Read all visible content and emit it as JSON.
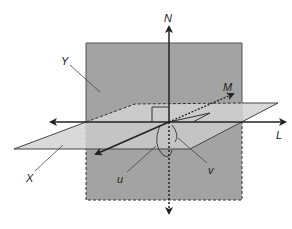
{
  "diagram": {
    "colors": {
      "vertical_plane_fill": "#a3a3a3",
      "horizontal_plane_fill": "#d2d2d2",
      "overlap_fill": "#bdbdbd",
      "line": "#222222",
      "background": "#ffffff"
    },
    "labels": {
      "N": "N",
      "M": "M",
      "L": "L",
      "Y": "Y",
      "X": "X",
      "u": "u",
      "v": "v"
    },
    "axes": [
      {
        "name": "N",
        "direction": "vertical",
        "from": [
          169,
          215
        ],
        "to": [
          169,
          25
        ]
      },
      {
        "name": "L",
        "direction": "horizontal",
        "from": [
          50,
          122
        ],
        "to": [
          286,
          122
        ]
      },
      {
        "name": "M",
        "direction": "oblique",
        "from": [
          95,
          154
        ],
        "to": [
          234,
          93
        ]
      }
    ],
    "planes": [
      {
        "name": "Y",
        "type": "vertical",
        "bounds": [
          86,
          43,
          242,
          200
        ]
      },
      {
        "name": "X",
        "type": "horizontal",
        "points": [
          [
            14,
            149
          ],
          [
            135,
            104
          ],
          [
            278,
            103
          ],
          [
            190,
            149
          ]
        ]
      }
    ],
    "angles": [
      {
        "name": "u",
        "type": "arc"
      },
      {
        "name": "v",
        "type": "arc"
      }
    ]
  }
}
